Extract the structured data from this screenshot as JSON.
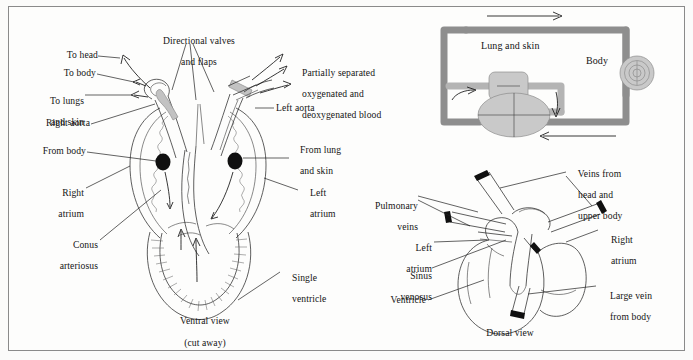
{
  "figure": {
    "title_present": false,
    "background_color": "#fdfdfc",
    "border_color": "#8a8a8a",
    "ink_color": "#141414",
    "vessel_color": "#8e8e8e",
    "organ_fill": "#c9c9c9"
  },
  "ventral_view": {
    "caption_line1": "Ventral view",
    "caption_line2": "(cut away)",
    "labels": {
      "directional_valves_l1": "Directional valves",
      "directional_valves_l2": "and flaps",
      "to_head": "To head",
      "to_body": "To body",
      "to_lungs_l1": "To lungs",
      "to_lungs_l2": "and skin",
      "right_aorta": "Right aorta",
      "from_body": "From body",
      "right_atrium_l1": "Right",
      "right_atrium_l2": "atrium",
      "conus_l1": "Conus",
      "conus_l2": "arteriosus",
      "partially_l1": "Partially separated",
      "partially_l2": "oxygenated and",
      "partially_l3": "deoxygenated blood",
      "left_aorta": "Left aorta",
      "from_lung_l1": "From lung",
      "from_lung_l2": "and skin",
      "left_atrium_l1": "Left",
      "left_atrium_l2": "atrium",
      "single_ventricle_l1": "Single",
      "single_ventricle_l2": "ventricle"
    }
  },
  "circulation_diagram": {
    "labels": {
      "lung_and_skin": "Lung and skin",
      "body": "Body"
    },
    "flow_arrows": [
      {
        "name": "top-arrow",
        "direction": "right"
      },
      {
        "name": "bottom-arrow",
        "direction": "left"
      },
      {
        "name": "left-inner-arrow",
        "direction": "right"
      },
      {
        "name": "right-inner-arrow",
        "direction": "down"
      }
    ]
  },
  "dorsal_view": {
    "caption": "Dorsal view",
    "labels": {
      "veins_from_head_l1": "Veins from",
      "veins_from_head_l2": "head and",
      "veins_from_head_l3": "upper body",
      "pulmonary_l1": "Pulmonary",
      "pulmonary_l2": "veins",
      "left_atrium_l1": "Left",
      "left_atrium_l2": "atrium",
      "sinus_l1": "Sinus",
      "sinus_l2": "venosus",
      "ventricle": "Ventricle",
      "right_atrium_l1": "Right",
      "right_atrium_l2": "atrium",
      "large_vein_l1": "Large vein",
      "large_vein_l2": "from body"
    }
  }
}
